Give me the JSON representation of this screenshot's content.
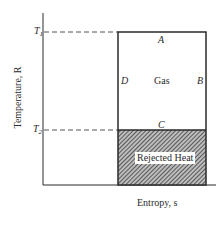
{
  "diagram": {
    "type": "temperature-entropy diagram",
    "y_axis_label": "Temperature, R",
    "x_axis_label": "Entropy, s",
    "levels": [
      {
        "name": "T1",
        "symbol": "T",
        "subscript": "1"
      },
      {
        "name": "T2",
        "symbol": "T",
        "subscript": "2"
      }
    ],
    "edges": {
      "top": "A",
      "right": "B",
      "bottom": "C",
      "left": "D"
    },
    "region_labels": {
      "upper": "Gas",
      "lower": "Rejected Heat"
    },
    "colors": {
      "line": "#2a2a2a",
      "dashed": "#555555",
      "hatch": "#3a3a3a",
      "background": "#ffffff"
    }
  }
}
